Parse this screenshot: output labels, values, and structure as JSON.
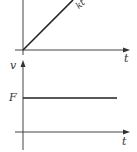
{
  "top_graph": {
    "x_axis_label": "t",
    "line_label": "kt",
    "line_type": "linear-increasing-from-origin"
  },
  "bottom_graph": {
    "y_axis_label": "v",
    "x_axis_label": "t",
    "level_label": "F",
    "line_type": "constant"
  },
  "colors": {
    "stroke": "#333333",
    "background": "#ffffff"
  }
}
